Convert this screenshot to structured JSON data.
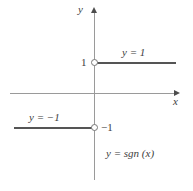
{
  "figure": {
    "caption_label": "y = sgn (x)",
    "axis_labels": {
      "x": "x",
      "y": "y"
    },
    "tick_labels": {
      "positive_one": "1",
      "negative_one": "−1"
    },
    "curve_labels": {
      "positive_branch": "y = 1",
      "negative_branch": "y = −1"
    },
    "colors": {
      "axis": "#9a9a9a",
      "curve": "#555555",
      "text": "#3d3d3d",
      "background": "#ffffff",
      "open_point_stroke": "#777777"
    }
  },
  "chart_data": {
    "type": "line",
    "title": "y = sgn (x)",
    "xlabel": "x",
    "ylabel": "y",
    "xlim": [
      -2.15,
      2.1
    ],
    "ylim": [
      -2.1,
      2.0
    ],
    "grid": false,
    "legend": "none",
    "series": [
      {
        "name": "y = 1",
        "label": "y = 1",
        "x": [
          0,
          2.05
        ],
        "values": [
          1,
          1
        ],
        "open_endpoint": {
          "x": 0,
          "y": 1
        },
        "endpoint_style": "open-circle-at-origin-side"
      },
      {
        "name": "y = −1",
        "label": "y = −1",
        "x": [
          -2.05,
          0
        ],
        "values": [
          -1,
          -1
        ],
        "open_endpoint": {
          "x": 0,
          "y": -1
        },
        "endpoint_style": "open-circle-at-origin-side"
      }
    ],
    "ytick_labels": [
      "1",
      "−1"
    ],
    "yticks": [
      1,
      -1
    ],
    "xtick_labels": [],
    "annotations": [
      {
        "text": "y = 1",
        "x": 0.85,
        "y": 1.45
      },
      {
        "text": "y = −1",
        "x": -1.35,
        "y": -0.55
      },
      {
        "text": "y = sgn (x)",
        "x": 0.45,
        "y": -1.6
      }
    ]
  }
}
